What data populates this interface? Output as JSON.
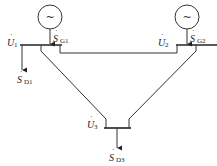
{
  "diagram": {
    "type": "three-bus power system network",
    "generators": [
      {
        "id": "G1",
        "symbol": "~",
        "bus": 1,
        "label_main": "S",
        "label_sub": "G1"
      },
      {
        "id": "G2",
        "symbol": "~",
        "bus": 2,
        "label_main": "S",
        "label_sub": "G2"
      }
    ],
    "buses": [
      {
        "id": 1,
        "voltage_main": "U",
        "voltage_sub": "1"
      },
      {
        "id": 2,
        "voltage_main": "U",
        "voltage_sub": "2"
      },
      {
        "id": 3,
        "voltage_main": "U",
        "voltage_sub": "3"
      }
    ],
    "loads": [
      {
        "bus": 1,
        "label_main": "S",
        "label_sub": "D1"
      },
      {
        "bus": 3,
        "label_main": "S",
        "label_sub": "D3"
      }
    ],
    "lines": [
      {
        "from": 1,
        "to": 2
      },
      {
        "from": 1,
        "to": 3
      },
      {
        "from": 2,
        "to": 3
      }
    ],
    "phasor_dot": "·"
  }
}
